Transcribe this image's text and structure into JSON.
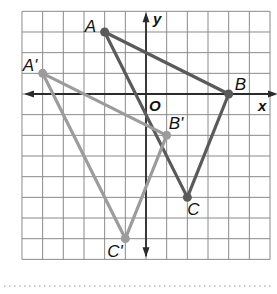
{
  "diagram": {
    "type": "coordinate-plane-transformation",
    "grid": {
      "x_min": -6,
      "x_max": 6,
      "y_min": -8,
      "y_max": 4,
      "cell_px": 20.67,
      "origin_px": [
        146,
        94
      ],
      "grid_color": "#8a8a8a",
      "axis_color": "#2b2b2b"
    },
    "axes": {
      "x_label": "x",
      "y_label": "y",
      "origin_label": "O"
    },
    "triangles": [
      {
        "name": "original",
        "color": "#5a5a5a",
        "vertices": [
          {
            "label": "A",
            "x": -2,
            "y": 3
          },
          {
            "label": "B",
            "x": 4,
            "y": 0
          },
          {
            "label": "C",
            "x": 2,
            "y": -5
          }
        ]
      },
      {
        "name": "image",
        "color": "#9c9c9c",
        "vertices": [
          {
            "label": "A'",
            "x": -5,
            "y": 1
          },
          {
            "label": "B'",
            "x": 1,
            "y": -2
          },
          {
            "label": "C'",
            "x": -1,
            "y": -7
          }
        ]
      }
    ],
    "separator": "dotted"
  }
}
